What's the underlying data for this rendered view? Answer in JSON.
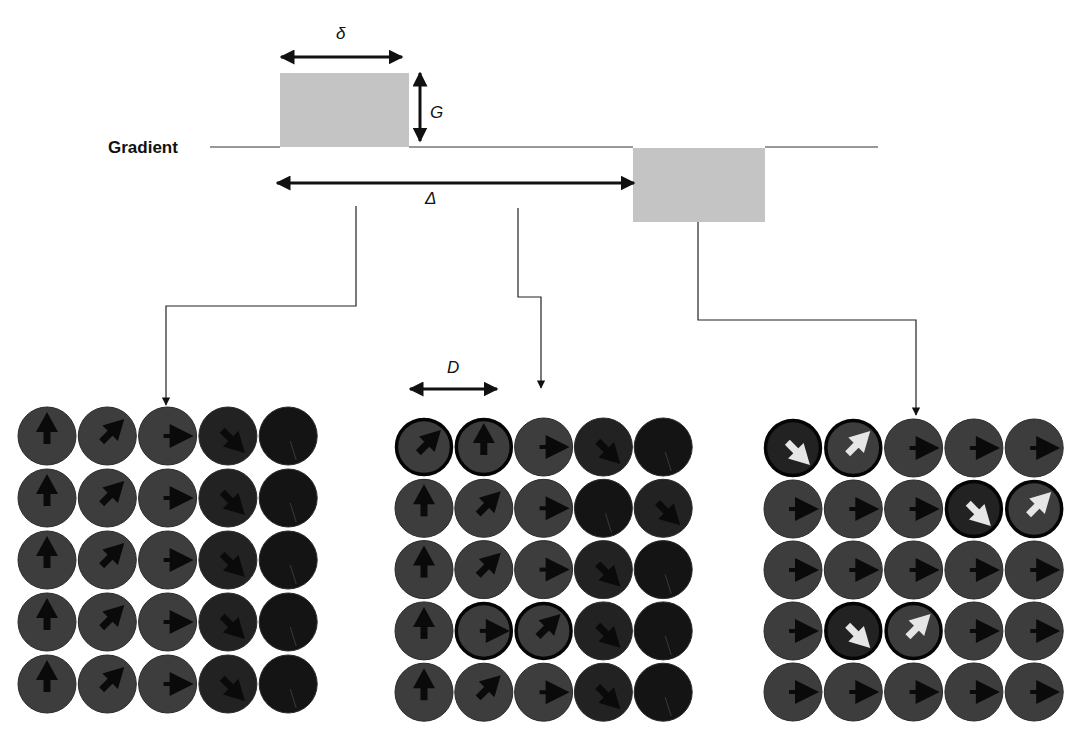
{
  "diagram": {
    "gradient_label": "Gradient",
    "symbols": {
      "delta_small": "δ",
      "G": "G",
      "Delta_big": "Δ",
      "D": "D"
    },
    "pulses": [
      {
        "name": "first-gradient-pulse",
        "x": 280,
        "y": 73,
        "w": 129,
        "h": 74,
        "direction": "positive"
      },
      {
        "name": "second-gradient-pulse",
        "x": 633,
        "y": 148,
        "w": 132,
        "h": 74,
        "direction": "negative"
      }
    ],
    "baseline": {
      "x1": 210,
      "x2": 878,
      "y": 147
    },
    "colors": {
      "pulse": "#c4c4c4",
      "spin_medium": "#3d3d3d",
      "spin_dark": "#222222",
      "spin_black": "#141414",
      "arrow_dark": "#0a0a0a",
      "arrow_light": "#e6e6e6",
      "line": "#222222"
    },
    "panels": [
      {
        "name": "panel-after-first-pulse",
        "caption": "",
        "origin_x": 47,
        "origin_y": 436,
        "pitch_x": 60.3,
        "pitch_y": 62,
        "rows": [
          [
            "up:m",
            "ne:m",
            "e:m",
            "se:d",
            "none:b"
          ],
          [
            "up:m",
            "ne:m",
            "e:m",
            "se:d",
            "none:b"
          ],
          [
            "up:m",
            "ne:m",
            "e:m",
            "se:d",
            "none:b"
          ],
          [
            "up:m",
            "ne:m",
            "e:m",
            "se:d",
            "none:b"
          ],
          [
            "up:m",
            "ne:m",
            "e:m",
            "se:d",
            "none:b"
          ]
        ]
      },
      {
        "name": "panel-during-diffusion",
        "caption": "",
        "origin_x": 424,
        "origin_y": 447,
        "pitch_x": 59.8,
        "pitch_y": 61.3,
        "rows": [
          [
            "ne:m:o",
            "up:m:o",
            "e:m",
            "se:d",
            "none:b"
          ],
          [
            "up:m",
            "ne:m",
            "e:m",
            "none:b",
            "se:d"
          ],
          [
            "up:m",
            "ne:m",
            "e:m",
            "se:d",
            "none:b"
          ],
          [
            "up:m",
            "e:m:o",
            "ne:m:o",
            "se:d",
            "none:b"
          ],
          [
            "up:m",
            "ne:m",
            "e:m",
            "se:d",
            "none:b"
          ]
        ]
      },
      {
        "name": "panel-after-second-pulse",
        "caption": "",
        "origin_x": 793,
        "origin_y": 448,
        "pitch_x": 60.3,
        "pitch_y": 61,
        "rows": [
          [
            "se:d:o:w",
            "ne:m:o:w",
            "e:m",
            "e:m",
            "e:m"
          ],
          [
            "e:m",
            "e:m",
            "e:m",
            "se:d:o:w",
            "ne:m:o:w"
          ],
          [
            "e:m",
            "e:m",
            "e:m",
            "e:m",
            "e:m"
          ],
          [
            "e:m",
            "se:d:o:w",
            "ne:m:o:w",
            "e:m",
            "e:m"
          ],
          [
            "e:m",
            "e:m",
            "e:m",
            "e:m",
            "e:m"
          ]
        ]
      }
    ],
    "connectors": [
      {
        "name": "connector-to-left-panel",
        "points": [
          [
            356,
            206
          ],
          [
            356,
            306
          ],
          [
            166,
            306
          ],
          [
            166,
            405
          ]
        ]
      },
      {
        "name": "connector-to-middle-panel",
        "points": [
          [
            518,
            208
          ],
          [
            518,
            297
          ],
          [
            541,
            297
          ],
          [
            541,
            388
          ]
        ]
      },
      {
        "name": "connector-to-right-panel",
        "points": [
          [
            698,
            222
          ],
          [
            698,
            320
          ],
          [
            916,
            320
          ],
          [
            916,
            415
          ]
        ]
      }
    ],
    "dimension_arrows": [
      {
        "name": "delta-small-arrow",
        "x1": 281,
        "y1": 57,
        "x2": 402,
        "y2": 57
      },
      {
        "name": "G-arrow",
        "x1": 420,
        "y1": 73,
        "x2": 420,
        "y2": 141
      },
      {
        "name": "Delta-big-arrow",
        "x1": 277,
        "y1": 183,
        "x2": 634,
        "y2": 183
      },
      {
        "name": "D-arrow",
        "x1": 410,
        "y1": 389,
        "x2": 497,
        "y2": 389
      }
    ],
    "spin_radius": 29
  }
}
